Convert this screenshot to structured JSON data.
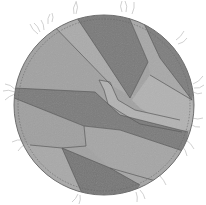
{
  "image": {
    "subject": "Circular patchwork quilted coaster with frayed threads",
    "palette": {
      "background": "#ffffff",
      "base_gray": "#9a9a9a",
      "light_gray": "#a9a9a9",
      "lighter_gray": "#b0b0b0",
      "dark_gray": "#7c7c7c",
      "darker_gray": "#747474",
      "stitch": "#555555",
      "thread": "#bdbdbd",
      "outline": "#6e6e6e"
    },
    "circle": {
      "cx": 104,
      "cy": 105,
      "r": 91
    }
  }
}
